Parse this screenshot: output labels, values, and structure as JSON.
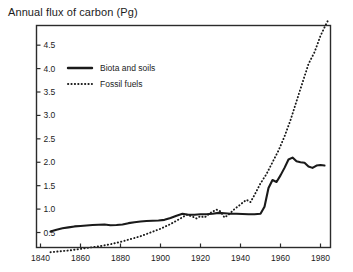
{
  "chart_data": {
    "type": "line",
    "title": "Annual flux of carbon (Pg)",
    "xlabel": "",
    "ylabel": "",
    "grid": false,
    "legend_position": "upper-left-inside",
    "xlim": [
      1838,
      1985
    ],
    "ylim": [
      0.18,
      4.92
    ],
    "xticks": [
      1840,
      1860,
      1880,
      1900,
      1920,
      1940,
      1960,
      1980
    ],
    "xticklabels": [
      "1840",
      "1860",
      "1880",
      "1900",
      "1920",
      "1940",
      "1960",
      "1980"
    ],
    "yticks": [
      0.5,
      1.0,
      1.5,
      2.0,
      2.5,
      3.0,
      3.5,
      4.0,
      4.5
    ],
    "yticklabels": [
      "0.5",
      "1.0",
      "1.5",
      "2.0",
      "2.5",
      "3.0",
      "3.5",
      "4.0",
      "4.5"
    ],
    "series": [
      {
        "name": "Biota and soils",
        "style": "solid",
        "color": "#1a1a1a",
        "x": [
          1845,
          1848,
          1851,
          1854,
          1857,
          1860,
          1863,
          1866,
          1869,
          1872,
          1875,
          1878,
          1881,
          1884,
          1887,
          1890,
          1893,
          1896,
          1899,
          1902,
          1905,
          1908,
          1911,
          1914,
          1917,
          1920,
          1923,
          1926,
          1929,
          1932,
          1935,
          1938,
          1941,
          1944,
          1947,
          1950,
          1952,
          1954,
          1956,
          1958,
          1960,
          1962,
          1964,
          1966,
          1968,
          1970,
          1972,
          1974,
          1976,
          1978,
          1980,
          1982
        ],
        "y": [
          0.52,
          0.56,
          0.59,
          0.61,
          0.63,
          0.64,
          0.65,
          0.66,
          0.665,
          0.67,
          0.655,
          0.66,
          0.67,
          0.7,
          0.72,
          0.735,
          0.745,
          0.75,
          0.755,
          0.77,
          0.81,
          0.86,
          0.9,
          0.88,
          0.88,
          0.89,
          0.89,
          0.9,
          0.92,
          0.91,
          0.9,
          0.9,
          0.895,
          0.89,
          0.89,
          0.9,
          1.05,
          1.45,
          1.62,
          1.58,
          1.72,
          1.88,
          2.06,
          2.1,
          2.02,
          2.0,
          1.99,
          1.91,
          1.88,
          1.93,
          1.94,
          1.93
        ]
      },
      {
        "name": "Fossil fuels",
        "style": "dotted",
        "color": "#1a1a1a",
        "x": [
          1845,
          1850,
          1855,
          1860,
          1865,
          1870,
          1875,
          1880,
          1885,
          1890,
          1895,
          1900,
          1905,
          1910,
          1913,
          1916,
          1918,
          1920,
          1922,
          1925,
          1928,
          1930,
          1932,
          1934,
          1937,
          1940,
          1943,
          1945,
          1947,
          1950,
          1953,
          1956,
          1959,
          1962,
          1965,
          1968,
          1971,
          1974,
          1977,
          1980,
          1982,
          1984
        ],
        "y": [
          0.08,
          0.1,
          0.12,
          0.15,
          0.18,
          0.21,
          0.25,
          0.3,
          0.36,
          0.42,
          0.5,
          0.58,
          0.68,
          0.8,
          0.88,
          0.84,
          0.8,
          0.85,
          0.82,
          0.92,
          0.99,
          0.95,
          0.82,
          0.88,
          1.0,
          1.1,
          1.2,
          1.15,
          1.3,
          1.55,
          1.75,
          2.0,
          2.25,
          2.55,
          2.9,
          3.3,
          3.7,
          4.1,
          4.35,
          4.7,
          4.88,
          5.05
        ]
      }
    ]
  },
  "legend": {
    "items": [
      {
        "label": "Biota and soils",
        "style": "solid"
      },
      {
        "label": "Fossil fuels",
        "style": "dotted"
      }
    ]
  },
  "frame": {
    "border_color": "#2b2b2b",
    "background": "#ffffff"
  }
}
